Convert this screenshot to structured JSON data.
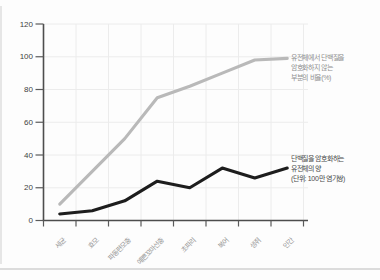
{
  "chart_data": {
    "type": "line",
    "categories": [
      "세균",
      "효모",
      "파동편모충",
      "예쁜꼬마선충",
      "초파리",
      "복어",
      "생쥐",
      "인간"
    ],
    "y_axis": {
      "min": 0,
      "max": 120,
      "step": 20,
      "tick_labels": [
        "0",
        "20",
        "40",
        "60",
        "80",
        "100",
        "120"
      ]
    },
    "grid": true,
    "legend_position": "right-annotations",
    "title": "",
    "xlabel": "",
    "ylabel": "",
    "series": [
      {
        "name": "유전체에서 단백질을 암호화하지 않는 부분의 비율(%)",
        "label_lines": [
          "유전체에서 단백질을",
          "암호화하지 않는",
          "부분의 비율(%)"
        ],
        "color": "#b9b9b9",
        "values": [
          10,
          30,
          50,
          75,
          82,
          90,
          98,
          99
        ]
      },
      {
        "name": "단백질을 암호화하는 유전체의 양 (단위: 100만 염기쌍)",
        "label_lines": [
          "단백질을 암호화하는",
          "유전체의 양",
          "(단위: 100만 염기쌍)"
        ],
        "color": "#1d1d1d",
        "values": [
          4,
          6,
          12,
          24,
          20,
          32,
          26,
          32
        ]
      }
    ],
    "colors": {
      "axis": "#4d4d4d",
      "grid": "#ececec",
      "tick": "#5a5a5a",
      "y_label": "#3f3f3f",
      "x_label": "#969696"
    }
  }
}
